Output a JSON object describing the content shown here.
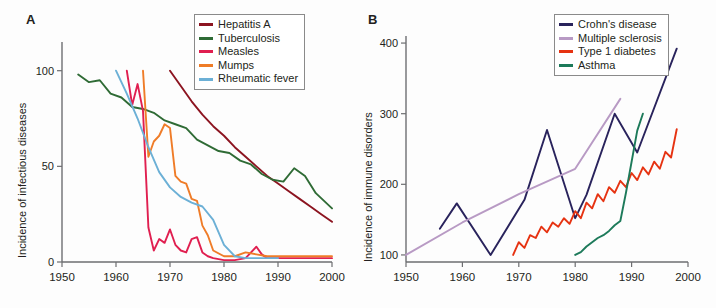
{
  "figure": {
    "panels": [
      {
        "letter": "A",
        "ylabel": "Incidence of infectious diseases",
        "legend": [
          {
            "label": "Hepatitis A",
            "color": "#8c1420"
          },
          {
            "label": "Tuberculosis",
            "color": "#2f6b35"
          },
          {
            "label": "Measles",
            "color": "#e01f50"
          },
          {
            "label": "Mumps",
            "color": "#ef7c28"
          },
          {
            "label": "Rheumatic fever",
            "color": "#6cb0d6"
          }
        ]
      },
      {
        "letter": "B",
        "ylabel": "Incidence of immune disorders",
        "legend": [
          {
            "label": "Crohn's disease",
            "color": "#29235c"
          },
          {
            "label": "Multiple sclerosis",
            "color": "#b89ac4"
          },
          {
            "label": "Type 1 diabetes",
            "color": "#e63312"
          },
          {
            "label": "Asthma",
            "color": "#1d7a5a"
          }
        ]
      }
    ]
  },
  "chart_data": [
    {
      "type": "line",
      "panel": "A",
      "title": "",
      "xlabel": "",
      "ylabel": "Incidence of infectious diseases",
      "xlim": [
        1950,
        2000
      ],
      "ylim": [
        0,
        115
      ],
      "xticks": [
        1950,
        1960,
        1970,
        1980,
        1990,
        2000
      ],
      "yticks": [
        0,
        50,
        100
      ],
      "grid": false,
      "legend_position": "top-right",
      "series": [
        {
          "name": "Hepatitis A",
          "color": "#8c1420",
          "x": [
            1970,
            1972,
            1974,
            1976,
            1978,
            1980,
            1982,
            1984,
            1986,
            1988,
            1990,
            1992,
            1994,
            1996,
            1998,
            2000
          ],
          "values": [
            100,
            92,
            84,
            77,
            71,
            66,
            60,
            55,
            50,
            45,
            41,
            37,
            33,
            29,
            25,
            21
          ]
        },
        {
          "name": "Tuberculosis",
          "color": "#2f6b35",
          "x": [
            1953,
            1955,
            1957,
            1959,
            1961,
            1963,
            1965,
            1967,
            1969,
            1971,
            1973,
            1975,
            1977,
            1979,
            1981,
            1983,
            1985,
            1987,
            1989,
            1991,
            1993,
            1995,
            1997,
            2000
          ],
          "values": [
            98,
            94,
            95,
            88,
            86,
            81,
            80,
            78,
            74,
            72,
            70,
            64,
            61,
            58,
            57,
            53,
            51,
            46,
            43,
            42,
            49,
            45,
            36,
            28
          ]
        },
        {
          "name": "Measles",
          "color": "#e01f50",
          "x": [
            1962,
            1963,
            1964,
            1965,
            1966,
            1967,
            1968,
            1969,
            1970,
            1971,
            1972,
            1973,
            1974,
            1975,
            1976,
            1977,
            1978,
            1980,
            1982,
            1984,
            1986,
            1987,
            1988,
            1990,
            1995,
            2000
          ],
          "values": [
            100,
            82,
            93,
            79,
            18,
            6,
            12,
            10,
            17,
            9,
            6,
            5,
            12,
            13,
            5,
            3,
            2,
            1,
            1,
            2,
            8,
            4,
            2,
            2,
            2,
            2
          ]
        },
        {
          "name": "Mumps",
          "color": "#ef7c28",
          "x": [
            1965,
            1966,
            1967,
            1968,
            1969,
            1970,
            1971,
            1972,
            1973,
            1974,
            1975,
            1976,
            1977,
            1978,
            1980,
            1982,
            1984,
            1986,
            1988,
            1990,
            1995,
            2000
          ],
          "values": [
            100,
            55,
            63,
            66,
            72,
            70,
            45,
            42,
            41,
            33,
            32,
            19,
            14,
            6,
            3,
            3,
            5,
            4,
            3,
            3,
            3,
            3
          ]
        },
        {
          "name": "Rheumatic fever",
          "color": "#6cb0d6",
          "x": [
            1960,
            1962,
            1964,
            1966,
            1968,
            1970,
            1972,
            1974,
            1976,
            1978,
            1980,
            1982,
            1984,
            1986,
            1988,
            1990
          ],
          "values": [
            100,
            88,
            75,
            60,
            47,
            39,
            34,
            31,
            29,
            22,
            9,
            3,
            2,
            2,
            2,
            2
          ]
        }
      ]
    },
    {
      "type": "line",
      "panel": "B",
      "title": "",
      "xlabel": "",
      "ylabel": "Incidence of immune disorders",
      "xlim": [
        1950,
        2000
      ],
      "ylim": [
        90,
        410
      ],
      "xticks": [
        1950,
        1960,
        1970,
        1980,
        1990,
        2000
      ],
      "yticks": [
        100,
        200,
        300,
        400
      ],
      "grid": false,
      "legend_position": "top-right",
      "series": [
        {
          "name": "Crohn's disease",
          "color": "#29235c",
          "x": [
            1956,
            1959,
            1965,
            1971,
            1975,
            1980,
            1982,
            1987,
            1991,
            1998
          ],
          "values": [
            137,
            173,
            100,
            178,
            277,
            152,
            185,
            300,
            245,
            392
          ]
        },
        {
          "name": "Multiple sclerosis",
          "color": "#b89ac4",
          "x": [
            1950,
            1960,
            1970,
            1980,
            1988
          ],
          "values": [
            100,
            146,
            186,
            222,
            321
          ]
        },
        {
          "name": "Type 1 diabetes",
          "color": "#e63312",
          "x": [
            1969,
            1970,
            1971,
            1972,
            1973,
            1974,
            1975,
            1976,
            1977,
            1978,
            1979,
            1980,
            1981,
            1982,
            1983,
            1984,
            1985,
            1986,
            1987,
            1988,
            1989,
            1990,
            1991,
            1992,
            1993,
            1994,
            1995,
            1996,
            1997,
            1998
          ],
          "values": [
            100,
            118,
            110,
            128,
            124,
            140,
            132,
            146,
            140,
            152,
            144,
            162,
            152,
            174,
            166,
            186,
            176,
            196,
            188,
            205,
            196,
            216,
            206,
            224,
            214,
            232,
            222,
            246,
            238,
            278
          ]
        },
        {
          "name": "Asthma",
          "color": "#1d7a5a",
          "x": [
            1980,
            1981,
            1982,
            1983,
            1984,
            1985,
            1986,
            1987,
            1988,
            1989,
            1990,
            1991,
            1992
          ],
          "values": [
            100,
            104,
            112,
            118,
            124,
            128,
            134,
            142,
            148,
            188,
            232,
            276,
            300
          ]
        }
      ]
    }
  ]
}
